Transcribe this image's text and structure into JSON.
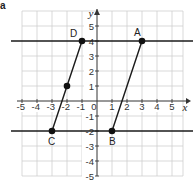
{
  "part_label": "a",
  "axes": {
    "x_label": "x",
    "y_label": "y",
    "x_ticks": [
      "-5",
      "-4",
      "-3",
      "-2",
      "-1",
      "0",
      "1",
      "2",
      "3",
      "4",
      "5"
    ],
    "y_ticks": [
      "5",
      "4",
      "3",
      "2",
      "1",
      "-1",
      "-2",
      "-3",
      "-4",
      "-5"
    ],
    "xlim": [
      -5,
      6
    ],
    "ylim": [
      -5,
      6
    ]
  },
  "horizontal_lines": [
    {
      "name": "y = 4",
      "y": 4
    },
    {
      "name": "y = -2",
      "y": -2
    }
  ],
  "segments": [
    {
      "name": "AB",
      "from": [
        3,
        4
      ],
      "to": [
        1,
        -2
      ]
    },
    {
      "name": "DC",
      "from": [
        -1,
        4
      ],
      "to": [
        -3,
        -2
      ]
    }
  ],
  "points": [
    {
      "label": "A",
      "x": 3,
      "y": 4
    },
    {
      "label": "B",
      "x": 1,
      "y": -2
    },
    {
      "label": "C",
      "x": -3,
      "y": -2
    },
    {
      "label": "D",
      "x": -1,
      "y": 4
    },
    {
      "label": "",
      "x": -2,
      "y": 1
    }
  ],
  "colors": {
    "grid": "#c8c8c8",
    "line": "#1a1a1a",
    "point": "#111111"
  }
}
